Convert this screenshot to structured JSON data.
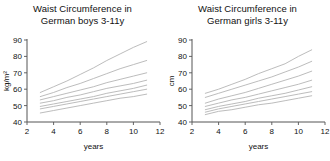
{
  "figure": {
    "background": "#ffffff",
    "curve_color": "#b4b4b4",
    "axis_color": "#555555",
    "text_color": "#111111"
  },
  "panels": {
    "left": {
      "title": "Waist Circumference in\nGerman boys 3-11y",
      "ylabel": "kg/m²",
      "xlabel": "years"
    },
    "right": {
      "title": "Waist Circumference in\nGerman girls 3-11y",
      "ylabel": "cm",
      "xlabel": "years"
    }
  },
  "chart_data": [
    {
      "type": "line",
      "title": "Waist Circumference in German boys 3-11y",
      "xlabel": "years",
      "ylabel": "kg/m²",
      "xlim": [
        2,
        12
      ],
      "ylim": [
        40,
        90
      ],
      "xticks": [
        2,
        4,
        6,
        8,
        10,
        12
      ],
      "yticks": [
        40,
        50,
        60,
        70,
        80,
        90
      ],
      "grid": false,
      "legend": "none",
      "x": [
        3,
        4,
        5,
        6,
        7,
        8,
        9,
        10,
        11
      ],
      "series": [
        {
          "name": "P97",
          "values": [
            58.0,
            61.5,
            65.0,
            69.0,
            73.0,
            77.5,
            81.5,
            85.5,
            89.0
          ]
        },
        {
          "name": "P90",
          "values": [
            55.5,
            58.0,
            61.0,
            63.5,
            66.5,
            69.5,
            72.5,
            75.0,
            77.5
          ]
        },
        {
          "name": "P75",
          "values": [
            53.5,
            55.5,
            57.5,
            59.5,
            61.5,
            64.0,
            66.0,
            68.0,
            70.0
          ]
        },
        {
          "name": "P50",
          "values": [
            51.5,
            53.0,
            55.0,
            56.5,
            58.5,
            60.5,
            62.0,
            63.5,
            65.5
          ]
        },
        {
          "name": "P25",
          "values": [
            49.5,
            51.0,
            52.5,
            54.0,
            55.5,
            57.5,
            59.0,
            60.5,
            62.5
          ]
        },
        {
          "name": "P10",
          "values": [
            48.0,
            49.5,
            51.0,
            52.5,
            54.0,
            55.5,
            57.0,
            58.5,
            60.0
          ]
        },
        {
          "name": "P3",
          "values": [
            45.5,
            47.0,
            48.5,
            50.0,
            51.5,
            53.0,
            54.5,
            55.5,
            57.0
          ]
        }
      ]
    },
    {
      "type": "line",
      "title": "Waist Circumference in German girls 3-11y",
      "xlabel": "years",
      "ylabel": "cm",
      "xlim": [
        2,
        12
      ],
      "ylim": [
        40,
        90
      ],
      "xticks": [
        2,
        4,
        6,
        8,
        10,
        12
      ],
      "yticks": [
        40,
        50,
        60,
        70,
        80,
        90
      ],
      "grid": false,
      "legend": "none",
      "x": [
        3,
        4,
        5,
        6,
        7,
        8,
        9,
        10,
        11
      ],
      "series": [
        {
          "name": "P97",
          "values": [
            57.5,
            60.0,
            63.0,
            66.0,
            69.5,
            72.5,
            75.5,
            80.0,
            84.0
          ]
        },
        {
          "name": "P90",
          "values": [
            55.0,
            57.5,
            60.0,
            62.5,
            65.0,
            67.5,
            70.5,
            73.5,
            77.0
          ]
        },
        {
          "name": "P75",
          "values": [
            51.5,
            54.0,
            56.0,
            58.0,
            60.5,
            63.0,
            65.5,
            68.0,
            71.0
          ]
        },
        {
          "name": "P50",
          "values": [
            49.5,
            51.5,
            53.5,
            55.0,
            57.0,
            59.0,
            61.0,
            63.0,
            65.5
          ]
        },
        {
          "name": "P25",
          "values": [
            47.5,
            49.5,
            51.0,
            52.5,
            54.5,
            56.0,
            57.5,
            59.5,
            61.5
          ]
        },
        {
          "name": "P10",
          "values": [
            46.0,
            48.0,
            49.5,
            51.0,
            52.5,
            54.0,
            55.5,
            57.0,
            58.5
          ]
        },
        {
          "name": "P3",
          "values": [
            44.5,
            46.5,
            47.5,
            49.0,
            50.5,
            51.5,
            53.0,
            54.5,
            56.0
          ]
        }
      ]
    }
  ]
}
